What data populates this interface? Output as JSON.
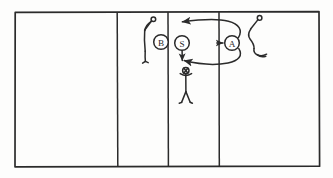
{
  "diagram": {
    "style": {
      "ink": "#2b2b2b",
      "paper": "#fdfdfc",
      "line_width": 1.6
    },
    "court": {
      "name": "court-outline",
      "x": 14,
      "y": 11,
      "width": 306,
      "height": 156,
      "vertical_lines": [
        117,
        168,
        219
      ]
    },
    "markers": [
      {
        "id": "marker-b",
        "label": "B",
        "cx": 161,
        "cy": 42,
        "r": 7.5
      },
      {
        "id": "marker-s",
        "label": "S",
        "cx": 182,
        "cy": 43,
        "r": 7.5
      },
      {
        "id": "marker-a",
        "label": "A",
        "cx": 232,
        "cy": 43,
        "r": 7.5
      }
    ],
    "players": [
      {
        "id": "player-left-setter",
        "pose": "arm-raised-side",
        "x": 147,
        "y": 20
      },
      {
        "id": "player-center-receiver",
        "pose": "front-arms-out",
        "x": 186,
        "y": 70
      },
      {
        "id": "player-right-attacker",
        "pose": "crouched-side",
        "x": 256,
        "y": 18
      }
    ],
    "arrows": [
      {
        "id": "arrow-a-to-left-top",
        "type": "curve",
        "head": "left",
        "from": "A",
        "to": "front-left"
      },
      {
        "id": "arrow-a-to-s-down",
        "type": "curve",
        "head": "left",
        "from": "A",
        "to": "center-back"
      },
      {
        "id": "arrow-into-a",
        "type": "straight",
        "head": "right",
        "from": "line",
        "to": "A"
      },
      {
        "id": "arrow-s-down",
        "type": "straight",
        "head": "down",
        "from": "S",
        "to": "center-player"
      }
    ]
  }
}
